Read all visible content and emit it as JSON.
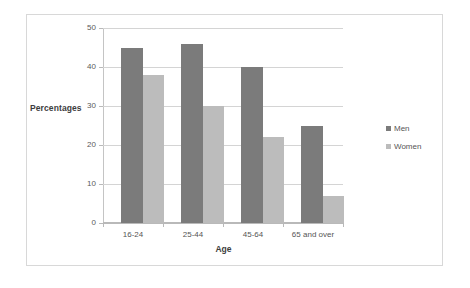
{
  "chart_data": {
    "type": "bar",
    "title": "",
    "subtitle": "",
    "xlabel": "Age",
    "ylabel": "Percentages",
    "categories": [
      "16-24",
      "25-44",
      "45-64",
      "65 and over"
    ],
    "series": [
      {
        "name": "Men",
        "values": [
          45,
          46,
          40,
          25
        ],
        "color": "#7b7b7b"
      },
      {
        "name": "Women",
        "values": [
          38,
          30,
          22,
          7
        ],
        "color": "#bcbcbc"
      }
    ],
    "ylim": [
      0,
      50
    ],
    "yticks": [
      0,
      10,
      20,
      30,
      40,
      50
    ],
    "ytick_labels": [
      "0",
      "10",
      "20",
      "30",
      "40",
      "50"
    ],
    "grid": true,
    "grid_axis": "y",
    "legend_position": "right"
  },
  "axes": {
    "y_title": "Percentages",
    "x_title": "Age",
    "y_ticks": [
      "50",
      "40",
      "30",
      "20",
      "10",
      "0"
    ],
    "x_ticks": [
      "16-24",
      "25-44",
      "45-64",
      "65 and over"
    ]
  },
  "legend": {
    "items": [
      {
        "label": "Men",
        "color": "#7b7b7b"
      },
      {
        "label": "Women",
        "color": "#bcbcbc"
      }
    ]
  },
  "colors": {
    "men": "#7b7b7b",
    "women": "#bcbcbc",
    "gridline": "#d4d4d4",
    "axis": "#b9b9b9",
    "frame": "#d8d8d8",
    "background": "#ffffff",
    "text": "#555555"
  }
}
